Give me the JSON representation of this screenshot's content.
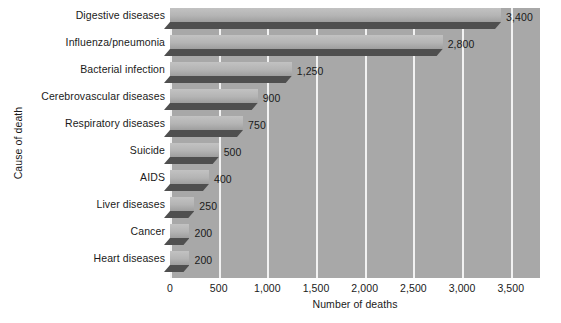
{
  "chart_data": {
    "type": "bar",
    "orientation": "horizontal",
    "title": "",
    "xlabel": "Number of deaths",
    "ylabel": "Cause of death",
    "categories": [
      "Digestive diseases",
      "Influenza/pneumonia",
      "Bacterial infection",
      "Cerebrovascular diseases",
      "Respiratory diseases",
      "Suicide",
      "AIDS",
      "Liver diseases",
      "Cancer",
      "Heart diseases"
    ],
    "values": [
      3400,
      2800,
      1250,
      900,
      750,
      500,
      400,
      250,
      200,
      200
    ],
    "value_labels": [
      "3,400",
      "2,800",
      "1,250",
      "900",
      "750",
      "500",
      "400",
      "250",
      "200",
      "200"
    ],
    "xlim": [
      0,
      3800
    ],
    "xticks": [
      0,
      500,
      1000,
      1500,
      2000,
      2500,
      3000,
      3500
    ],
    "xtick_labels": [
      "0",
      "500",
      "1,000",
      "1,500",
      "2,000",
      "2,500",
      "3,000",
      "3,500"
    ],
    "grid": true,
    "gridline_color": "#f2f2f2",
    "plot_background": "#a8a8a8",
    "bar_face_color": "#b4b4b4",
    "bar_shadow_color": "#4f4f4f",
    "legend": null,
    "legend_position": "none",
    "style": "3d-horizontal-bars"
  }
}
